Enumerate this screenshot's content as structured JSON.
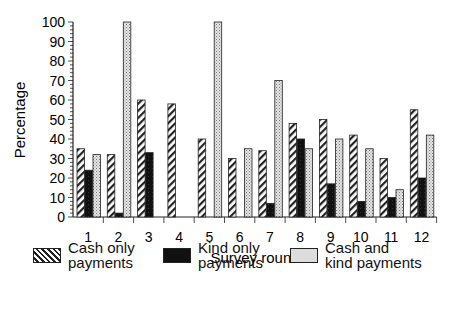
{
  "chart_data": {
    "type": "bar",
    "title": "",
    "xlabel": "Survey round",
    "ylabel": "Percentage",
    "ylim": [
      0,
      100
    ],
    "yticks": [
      0,
      10,
      20,
      30,
      40,
      50,
      60,
      70,
      80,
      90,
      100
    ],
    "grid": false,
    "legend_position": "bottom",
    "categories": [
      "1",
      "2",
      "3",
      "4",
      "5",
      "6",
      "7",
      "8",
      "9",
      "10",
      "11",
      "12"
    ],
    "series": [
      {
        "name": "Cash only payments",
        "pattern": "diagonal-hatch",
        "values": [
          35,
          32,
          60,
          58,
          40,
          30,
          34,
          48,
          50,
          42,
          30,
          55
        ]
      },
      {
        "name": "Kind only payments",
        "pattern": "solid-black",
        "values": [
          24,
          2,
          33,
          0,
          0,
          0,
          7,
          40,
          17,
          8,
          10,
          20
        ]
      },
      {
        "name": "Cash and kind payments",
        "pattern": "light-stipple",
        "values": [
          32,
          100,
          0,
          0,
          100,
          35,
          70,
          35,
          40,
          35,
          14,
          42
        ]
      }
    ]
  },
  "legend": [
    {
      "label": "Cash only\npayments"
    },
    {
      "label": "Kind only\npayments"
    },
    {
      "label": "Cash and\nkind payments"
    }
  ]
}
